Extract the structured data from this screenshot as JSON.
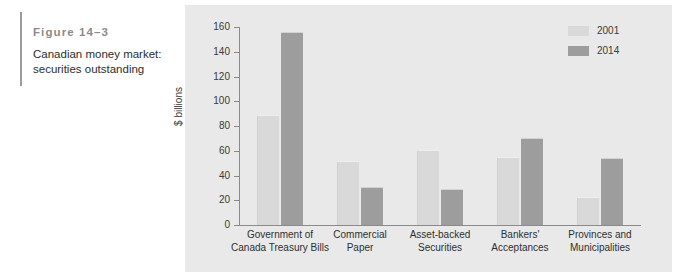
{
  "caption": {
    "figure_number": "Figure 14–3",
    "title": "Canadian money market: securities outstanding"
  },
  "legend": {
    "position": "top-right",
    "entries": [
      {
        "label": "2001",
        "color": "#d9d9d9"
      },
      {
        "label": "2014",
        "color": "#9d9d9d"
      }
    ]
  },
  "axes": {
    "ylabel": "$ billions",
    "yticks": [
      "0",
      "20",
      "40",
      "60",
      "80",
      "100",
      "120",
      "140",
      "160"
    ]
  },
  "chart_data": {
    "type": "bar",
    "title": "Canadian money market: securities outstanding",
    "xlabel": "",
    "ylabel": "$ billions",
    "ylim": [
      0,
      160
    ],
    "ytick_step": 20,
    "grid": false,
    "legend_position": "upper right",
    "categories": [
      "Government of Canada Treasury Bills",
      "Commercial Paper",
      "Asset-backed Securities",
      "Bankers' Acceptances",
      "Provinces and Municipalities"
    ],
    "category_lines": [
      [
        "Government of",
        "Canada Treasury Bills"
      ],
      [
        "Commercial",
        "Paper"
      ],
      [
        "Asset-backed",
        "Securities"
      ],
      [
        "Bankers'",
        "Acceptances"
      ],
      [
        "Provinces and",
        "Municipalities"
      ]
    ],
    "series": [
      {
        "name": "2001",
        "color": "#d9d9d9",
        "values": [
          89,
          52,
          61,
          55,
          23
        ]
      },
      {
        "name": "2014",
        "color": "#9d9d9d",
        "values": [
          156,
          31,
          29,
          70,
          54
        ]
      }
    ]
  }
}
